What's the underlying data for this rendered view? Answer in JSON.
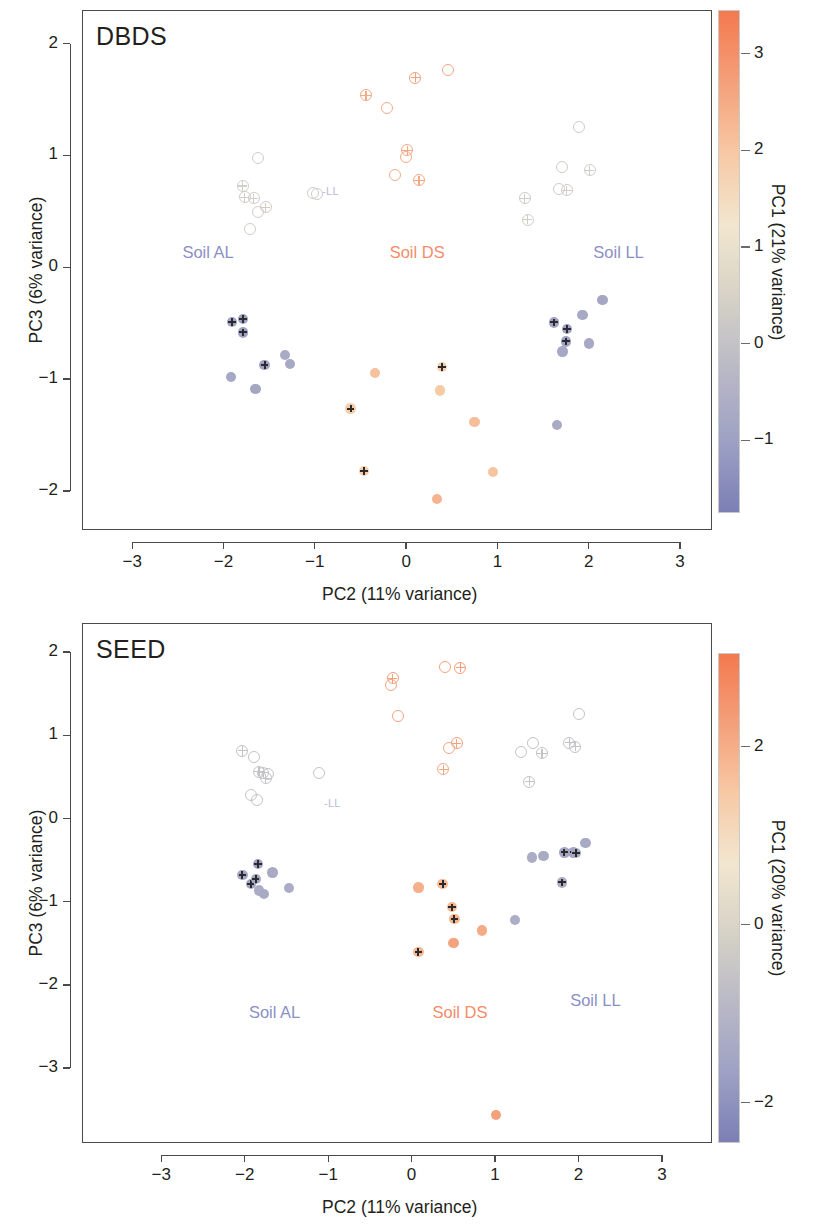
{
  "figure": {
    "type": "scatter-pca-panels",
    "background": "#ffffff",
    "panels": [
      "DBDS",
      "SEED"
    ]
  },
  "chart_data": [
    {
      "type": "scatter",
      "title": "DBDS",
      "xlabel": "PC2 (11% variance)",
      "ylabel": "PC3 (6% variance)",
      "xlim": [
        -3.55,
        3.35
      ],
      "ylim": [
        -2.35,
        2.3
      ],
      "xticks": [
        -3,
        -2,
        -1,
        0,
        1,
        2,
        3
      ],
      "xticklabels": [
        "-3",
        "-2",
        "-1",
        "0",
        "1",
        "2",
        "3"
      ],
      "yticks": [
        2,
        1,
        0,
        -1,
        -2
      ],
      "yticklabels": [
        "2",
        "1",
        "0",
        "-1",
        "-2"
      ],
      "grid": false,
      "legend": "none",
      "colorbar": {
        "label": "PC1 (21% variance)",
        "ticks": [
          3,
          2,
          1,
          0,
          -1
        ],
        "ticklabels": [
          "3",
          "2",
          "1",
          "0",
          "-1"
        ],
        "vmin": -1.75,
        "vmax": 3.45,
        "colors": [
          "#7b7fb5",
          "#9ea1c4",
          "#b9b9c6",
          "#d6d2c6",
          "#f2e6cf",
          "#f7c9a5",
          "#f4a07a",
          "#f4794f"
        ]
      },
      "annotations": [
        {
          "text": "Soil AL",
          "x": -2.45,
          "y": 0.12,
          "color": "#8a90c4"
        },
        {
          "text": "Soil DS",
          "x": -0.18,
          "y": 0.12,
          "color": "#f48c6a"
        },
        {
          "text": "Soil LL",
          "x": 2.05,
          "y": 0.12,
          "color": "#8a90c4"
        },
        {
          "text": "-LL",
          "x": -0.92,
          "y": 0.67,
          "color": "#b9bbd3"
        }
      ],
      "points": [
        {
          "x": -1.63,
          "y": 0.985,
          "pc1": 0.35,
          "fill": "open",
          "plus": false
        },
        {
          "x": -1.8,
          "y": 0.735,
          "pc1": 0.35,
          "fill": "open",
          "plus": true
        },
        {
          "x": -1.78,
          "y": 0.635,
          "pc1": 0.3,
          "fill": "open",
          "plus": true
        },
        {
          "x": -1.68,
          "y": 0.625,
          "pc1": 0.32,
          "fill": "open",
          "plus": true
        },
        {
          "x": -1.55,
          "y": 0.545,
          "pc1": 0.3,
          "fill": "open",
          "plus": true
        },
        {
          "x": -1.63,
          "y": 0.505,
          "pc1": 0.34,
          "fill": "open",
          "plus": false
        },
        {
          "x": -1.72,
          "y": 0.355,
          "pc1": 0.34,
          "fill": "open",
          "plus": false
        },
        {
          "x": -1.03,
          "y": 0.675,
          "pc1": 0.3,
          "fill": "open",
          "plus": false
        },
        {
          "x": -0.99,
          "y": 0.665,
          "pc1": 0.3,
          "fill": "open",
          "plus": false
        },
        {
          "x": -0.45,
          "y": 1.545,
          "pc1": 2.55,
          "fill": "open",
          "plus": true
        },
        {
          "x": -0.22,
          "y": 1.435,
          "pc1": 2.45,
          "fill": "open",
          "plus": false
        },
        {
          "x": 0.09,
          "y": 1.705,
          "pc1": 2.7,
          "fill": "open",
          "plus": true
        },
        {
          "x": 0.45,
          "y": 1.775,
          "pc1": 2.6,
          "fill": "open",
          "plus": false
        },
        {
          "x": 0.0,
          "y": 1.055,
          "pc1": 2.55,
          "fill": "open",
          "plus": true
        },
        {
          "x": -0.01,
          "y": 0.995,
          "pc1": 2.5,
          "fill": "open",
          "plus": false
        },
        {
          "x": -0.13,
          "y": 0.835,
          "pc1": 2.45,
          "fill": "open",
          "plus": false
        },
        {
          "x": 0.13,
          "y": 0.785,
          "pc1": 2.55,
          "fill": "open",
          "plus": true
        },
        {
          "x": 1.29,
          "y": 0.625,
          "pc1": 0.3,
          "fill": "open",
          "plus": true
        },
        {
          "x": 1.66,
          "y": 0.705,
          "pc1": 0.32,
          "fill": "open",
          "plus": false
        },
        {
          "x": 1.75,
          "y": 0.695,
          "pc1": 0.34,
          "fill": "open",
          "plus": true
        },
        {
          "x": 1.7,
          "y": 0.905,
          "pc1": 0.33,
          "fill": "open",
          "plus": false
        },
        {
          "x": 1.88,
          "y": 1.265,
          "pc1": 0.3,
          "fill": "open",
          "plus": false
        },
        {
          "x": 2.0,
          "y": 0.875,
          "pc1": 0.35,
          "fill": "open",
          "plus": true
        },
        {
          "x": 1.32,
          "y": 0.435,
          "pc1": 0.32,
          "fill": "open",
          "plus": true
        },
        {
          "x": -1.92,
          "y": -0.48,
          "pc1": -0.95,
          "fill": "filled",
          "plus": true
        },
        {
          "x": -1.8,
          "y": -0.455,
          "pc1": -1.05,
          "fill": "filled",
          "plus": true
        },
        {
          "x": -1.8,
          "y": -0.575,
          "pc1": -1.0,
          "fill": "filled",
          "plus": true
        },
        {
          "x": -1.93,
          "y": -0.975,
          "pc1": -0.8,
          "fill": "filled",
          "plus": false
        },
        {
          "x": -1.66,
          "y": -1.08,
          "pc1": -0.85,
          "fill": "filled",
          "plus": false
        },
        {
          "x": -1.56,
          "y": -0.865,
          "pc1": -0.95,
          "fill": "filled",
          "plus": true
        },
        {
          "x": -1.34,
          "y": -0.775,
          "pc1": -0.7,
          "fill": "filled",
          "plus": false
        },
        {
          "x": -1.28,
          "y": -0.855,
          "pc1": -0.75,
          "fill": "filled",
          "plus": false
        },
        {
          "x": -0.62,
          "y": -1.255,
          "pc1": 1.85,
          "fill": "filled",
          "plus": true
        },
        {
          "x": -0.35,
          "y": -0.935,
          "pc1": 2.1,
          "fill": "filled",
          "plus": false
        },
        {
          "x": -0.47,
          "y": -1.815,
          "pc1": 1.8,
          "fill": "filled",
          "plus": true
        },
        {
          "x": 0.38,
          "y": -0.885,
          "pc1": 1.75,
          "fill": "filled",
          "plus": true
        },
        {
          "x": 0.36,
          "y": -1.095,
          "pc1": 1.95,
          "fill": "filled",
          "plus": false
        },
        {
          "x": 0.33,
          "y": -2.065,
          "pc1": 2.35,
          "fill": "filled",
          "plus": false
        },
        {
          "x": 0.74,
          "y": -1.375,
          "pc1": 2.15,
          "fill": "filled",
          "plus": false
        },
        {
          "x": 0.94,
          "y": -1.825,
          "pc1": 2.05,
          "fill": "filled",
          "plus": false
        },
        {
          "x": 1.61,
          "y": -0.485,
          "pc1": -0.95,
          "fill": "filled",
          "plus": true
        },
        {
          "x": 1.75,
          "y": -0.545,
          "pc1": -1.0,
          "fill": "filled",
          "plus": true
        },
        {
          "x": 1.74,
          "y": -0.655,
          "pc1": -0.95,
          "fill": "filled",
          "plus": true
        },
        {
          "x": 1.7,
          "y": -0.745,
          "pc1": -0.8,
          "fill": "filled",
          "plus": false
        },
        {
          "x": 1.92,
          "y": -0.42,
          "pc1": -0.75,
          "fill": "filled",
          "plus": false
        },
        {
          "x": 1.99,
          "y": -0.675,
          "pc1": -0.8,
          "fill": "filled",
          "plus": false
        },
        {
          "x": 2.14,
          "y": -0.285,
          "pc1": -0.85,
          "fill": "filled",
          "plus": false
        },
        {
          "x": 1.64,
          "y": -1.4,
          "pc1": -0.7,
          "fill": "filled",
          "plus": false
        }
      ]
    },
    {
      "type": "scatter",
      "title": "SEED",
      "xlabel": "PC2 (11% variance)",
      "ylabel": "PC3 (6% variance)",
      "xlim": [
        -3.95,
        3.6
      ],
      "ylim": [
        -3.9,
        2.35
      ],
      "xticks": [
        -3,
        -2,
        -1,
        0,
        1,
        2,
        3
      ],
      "xticklabels": [
        "-3",
        "-2",
        "-1",
        "0",
        "1",
        "2",
        "3"
      ],
      "yticks": [
        2,
        1,
        0,
        -1,
        -2,
        -3
      ],
      "yticklabels": [
        "2",
        "1",
        "0",
        "-1",
        "-2",
        "-3"
      ],
      "grid": false,
      "legend": "none",
      "colorbar": {
        "label": "PC1 (20% variance)",
        "ticks": [
          2,
          0,
          -2
        ],
        "ticklabels": [
          "2",
          "0",
          "-2"
        ],
        "vmin": -2.45,
        "vmax": 3.05,
        "colors": [
          "#7b7fb5",
          "#9ea1c4",
          "#b9b9c6",
          "#d6d2c6",
          "#f2e6cf",
          "#f7c9a5",
          "#f4a07a",
          "#f4794f"
        ]
      },
      "annotations": [
        {
          "text": "Soil AL",
          "x": -1.95,
          "y": -2.35,
          "color": "#8a90c4"
        },
        {
          "text": "Soil DS",
          "x": 0.25,
          "y": -2.35,
          "color": "#f48c6a"
        },
        {
          "text": "Soil LL",
          "x": 1.9,
          "y": -2.2,
          "color": "#8a90c4"
        },
        {
          "text": "-LL",
          "x": -1.05,
          "y": 0.18,
          "color": "#b9bbd3"
        }
      ],
      "points": [
        {
          "x": -2.04,
          "y": 0.825,
          "pc1": -0.6,
          "fill": "open",
          "plus": true
        },
        {
          "x": -1.9,
          "y": 0.755,
          "pc1": -0.55,
          "fill": "open",
          "plus": false
        },
        {
          "x": -1.84,
          "y": 0.575,
          "pc1": -0.6,
          "fill": "open",
          "plus": true
        },
        {
          "x": -1.79,
          "y": 0.565,
          "pc1": -0.58,
          "fill": "open",
          "plus": true
        },
        {
          "x": -1.73,
          "y": 0.545,
          "pc1": -0.62,
          "fill": "open",
          "plus": false
        },
        {
          "x": -1.76,
          "y": 0.495,
          "pc1": -0.6,
          "fill": "open",
          "plus": true
        },
        {
          "x": -1.94,
          "y": 0.295,
          "pc1": -0.55,
          "fill": "open",
          "plus": false
        },
        {
          "x": -1.86,
          "y": 0.235,
          "pc1": -0.55,
          "fill": "open",
          "plus": false
        },
        {
          "x": -1.12,
          "y": 0.565,
          "pc1": -0.55,
          "fill": "open",
          "plus": false
        },
        {
          "x": -0.24,
          "y": 1.695,
          "pc1": 2.25,
          "fill": "open",
          "plus": true
        },
        {
          "x": -0.26,
          "y": 1.615,
          "pc1": 2.2,
          "fill": "open",
          "plus": false
        },
        {
          "x": -0.18,
          "y": 1.245,
          "pc1": 2.2,
          "fill": "open",
          "plus": false
        },
        {
          "x": 0.39,
          "y": 1.835,
          "pc1": 2.25,
          "fill": "open",
          "plus": false
        },
        {
          "x": 0.57,
          "y": 1.825,
          "pc1": 2.3,
          "fill": "open",
          "plus": true
        },
        {
          "x": 0.53,
          "y": 0.915,
          "pc1": 2.2,
          "fill": "open",
          "plus": true
        },
        {
          "x": 0.44,
          "y": 0.865,
          "pc1": 2.15,
          "fill": "open",
          "plus": false
        },
        {
          "x": 0.37,
          "y": 0.605,
          "pc1": 2.1,
          "fill": "open",
          "plus": true
        },
        {
          "x": 1.3,
          "y": 0.815,
          "pc1": -0.55,
          "fill": "open",
          "plus": false
        },
        {
          "x": 1.44,
          "y": 0.925,
          "pc1": -0.6,
          "fill": "open",
          "plus": false
        },
        {
          "x": 1.55,
          "y": 0.795,
          "pc1": -0.58,
          "fill": "open",
          "plus": true
        },
        {
          "x": 1.88,
          "y": 0.925,
          "pc1": -0.6,
          "fill": "open",
          "plus": true
        },
        {
          "x": 1.95,
          "y": 0.875,
          "pc1": -0.62,
          "fill": "open",
          "plus": true
        },
        {
          "x": 2.0,
          "y": 1.265,
          "pc1": -0.55,
          "fill": "open",
          "plus": false
        },
        {
          "x": 1.4,
          "y": 0.455,
          "pc1": -0.58,
          "fill": "open",
          "plus": true
        },
        {
          "x": -2.04,
          "y": -0.665,
          "pc1": -1.45,
          "fill": "filled",
          "plus": true
        },
        {
          "x": -1.94,
          "y": -0.775,
          "pc1": -1.55,
          "fill": "filled",
          "plus": true
        },
        {
          "x": -1.88,
          "y": -0.715,
          "pc1": -1.5,
          "fill": "filled",
          "plus": true
        },
        {
          "x": -1.85,
          "y": -0.535,
          "pc1": -1.6,
          "fill": "filled",
          "plus": true
        },
        {
          "x": -1.84,
          "y": -0.855,
          "pc1": -1.3,
          "fill": "filled",
          "plus": false
        },
        {
          "x": -1.78,
          "y": -0.895,
          "pc1": -1.35,
          "fill": "filled",
          "plus": false
        },
        {
          "x": -1.68,
          "y": -0.635,
          "pc1": -1.35,
          "fill": "filled",
          "plus": false
        },
        {
          "x": -1.48,
          "y": -0.825,
          "pc1": -1.3,
          "fill": "filled",
          "plus": false
        },
        {
          "x": 0.07,
          "y": -0.815,
          "pc1": 1.95,
          "fill": "filled",
          "plus": false
        },
        {
          "x": 0.36,
          "y": -0.775,
          "pc1": 1.75,
          "fill": "filled",
          "plus": true
        },
        {
          "x": 0.47,
          "y": -1.055,
          "pc1": 1.8,
          "fill": "filled",
          "plus": true
        },
        {
          "x": 0.5,
          "y": -1.195,
          "pc1": 1.85,
          "fill": "filled",
          "plus": true
        },
        {
          "x": 0.07,
          "y": -1.595,
          "pc1": 1.8,
          "fill": "filled",
          "plus": true
        },
        {
          "x": 0.49,
          "y": -1.485,
          "pc1": 2.2,
          "fill": "filled",
          "plus": false
        },
        {
          "x": 0.83,
          "y": -1.335,
          "pc1": 2.05,
          "fill": "filled",
          "plus": false
        },
        {
          "x": 1.0,
          "y": -3.555,
          "pc1": 2.25,
          "fill": "filled",
          "plus": false
        },
        {
          "x": 1.23,
          "y": -1.205,
          "pc1": -1.25,
          "fill": "filled",
          "plus": false
        },
        {
          "x": 1.43,
          "y": -0.455,
          "pc1": -1.3,
          "fill": "filled",
          "plus": false
        },
        {
          "x": 1.57,
          "y": -0.435,
          "pc1": -1.35,
          "fill": "filled",
          "plus": false
        },
        {
          "x": 1.82,
          "y": -0.395,
          "pc1": -1.45,
          "fill": "filled",
          "plus": true
        },
        {
          "x": 1.93,
          "y": -0.395,
          "pc1": -1.5,
          "fill": "filled",
          "plus": true
        },
        {
          "x": 1.96,
          "y": -0.405,
          "pc1": -1.45,
          "fill": "filled",
          "plus": true
        },
        {
          "x": 2.07,
          "y": -0.285,
          "pc1": -1.4,
          "fill": "filled",
          "plus": false
        },
        {
          "x": 1.79,
          "y": -0.755,
          "pc1": -1.3,
          "fill": "filled",
          "plus": true
        }
      ]
    }
  ]
}
